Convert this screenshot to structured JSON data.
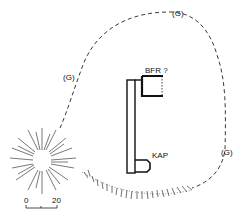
{
  "diagram": {
    "type": "site-plan",
    "labels": {
      "bfr": "BFR ?",
      "kap": "KAP",
      "g_top": "(G)",
      "g_left": "(G)",
      "g_right": "(G)"
    },
    "scale_bar": {
      "start": "0",
      "end": "20"
    },
    "colors": {
      "ink": "#111111",
      "background": "#ffffff"
    }
  }
}
